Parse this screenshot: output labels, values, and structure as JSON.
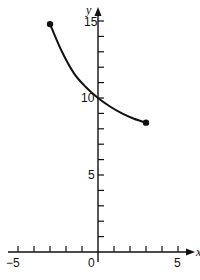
{
  "chart_data": {
    "type": "line",
    "title": "",
    "xlabel": "x",
    "ylabel": "y",
    "xlim": [
      -5,
      5
    ],
    "ylim": [
      0,
      15
    ],
    "grid": false,
    "x_ticks": [
      -5,
      -4,
      -3,
      -2,
      -1,
      0,
      1,
      2,
      3,
      4,
      5
    ],
    "x_tick_labels": [
      "−5",
      "0",
      "5"
    ],
    "y_ticks": [
      1,
      2,
      3,
      4,
      5,
      6,
      7,
      8,
      9,
      10,
      11,
      12,
      13,
      14,
      15
    ],
    "y_tick_labels": [
      "5",
      "10",
      "15"
    ],
    "series": [
      {
        "name": "curve",
        "x": [
          -3,
          -2.25,
          -1.5,
          -0.75,
          0,
          0.75,
          1.5,
          2.25,
          3
        ],
        "y": [
          14.8,
          13.0,
          11.6,
          10.7,
          10.0,
          9.45,
          9.0,
          8.65,
          8.4
        ],
        "endpoints": [
          [
            -3,
            14.8
          ],
          [
            3,
            8.4
          ]
        ]
      }
    ]
  },
  "labels": {
    "y_axis": "y",
    "x_axis": "x",
    "x_neg5": "−5",
    "x_0": "0",
    "x_5": "5",
    "y_5": "5",
    "y_10": "10",
    "y_15": "15"
  }
}
